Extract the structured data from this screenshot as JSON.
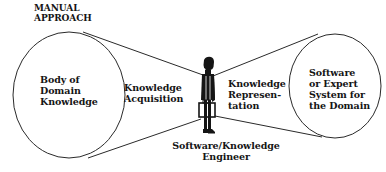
{
  "diagram": {
    "title": "MANUAL\nAPPROACH",
    "nodes": {
      "source": {
        "label": "Body of\nDomain\nKnowledge",
        "shape": "ellipse"
      },
      "actor": {
        "label": "Software/Knowledge\nEngineer",
        "shape": "person-figure"
      },
      "target": {
        "label": "Software\nor Expert\nSystem for\nthe Domain",
        "shape": "ellipse"
      }
    },
    "edges": [
      {
        "from": "source",
        "to": "actor",
        "label": "Knowledge\nAcquisition"
      },
      {
        "from": "actor",
        "to": "target",
        "label": "Knowledge\nRepresen-\ntation"
      }
    ],
    "colors": {
      "line": "#2a2a2a",
      "text": "#151515",
      "background": "#ffffff"
    }
  }
}
